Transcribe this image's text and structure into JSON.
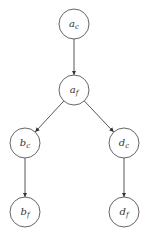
{
  "diagram": {
    "type": "directed-tree",
    "nodes": [
      {
        "id": "ac",
        "base": "a",
        "sub": "c",
        "x": 74,
        "y": 24
      },
      {
        "id": "af",
        "base": "a",
        "sub": "f",
        "x": 74,
        "y": 90
      },
      {
        "id": "bc",
        "base": "b",
        "sub": "c",
        "x": 25,
        "y": 143
      },
      {
        "id": "dc",
        "base": "d",
        "sub": "c",
        "x": 124,
        "y": 143
      },
      {
        "id": "bf",
        "base": "b",
        "sub": "f",
        "x": 25,
        "y": 212
      },
      {
        "id": "df",
        "base": "d",
        "sub": "f",
        "x": 124,
        "y": 212
      }
    ],
    "edges": [
      {
        "from": "ac",
        "to": "af"
      },
      {
        "from": "af",
        "to": "bc"
      },
      {
        "from": "af",
        "to": "dc"
      },
      {
        "from": "bc",
        "to": "bf"
      },
      {
        "from": "dc",
        "to": "df"
      }
    ],
    "node_radius": 15,
    "colors": {
      "stroke": "#555555",
      "text": "#333333",
      "background": "#ffffff"
    }
  }
}
